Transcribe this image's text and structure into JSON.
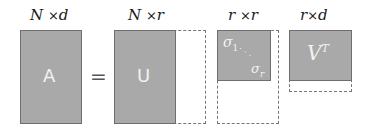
{
  "diagram": {
    "matrices": [
      {
        "id": "A",
        "dims": {
          "rows": "N",
          "cols": "d"
        },
        "label": "A"
      },
      {
        "id": "U",
        "dims": {
          "rows": "N",
          "cols": "r"
        },
        "label": "U"
      },
      {
        "id": "Sigma",
        "dims": {
          "rows": "r",
          "cols": "r"
        },
        "diag_start": "σ",
        "diag_start_sub": "1",
        "diag_dots": "· · ·",
        "diag_end": "σ",
        "diag_end_sub": "r"
      },
      {
        "id": "VT",
        "dims": {
          "rows": "r",
          "cols": "d"
        },
        "label": "V",
        "label_sup": "T"
      }
    ],
    "times": "×",
    "equals": "=",
    "colors": {
      "fill": "#a9a9a9",
      "border": "#6e6e6e",
      "dashed": "#777777",
      "label_text": "#f2f2f2"
    }
  }
}
